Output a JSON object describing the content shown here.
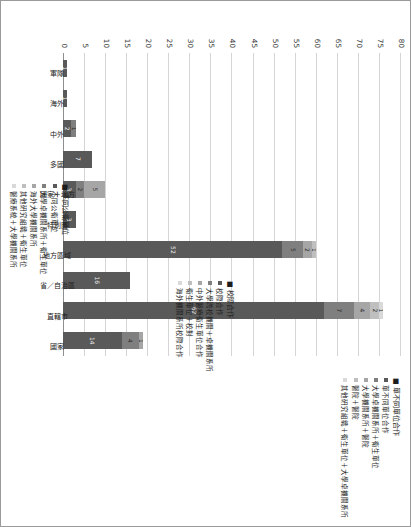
{
  "figure": {
    "orientation_note": "chart printed rotated 90 degrees on a portrait page"
  },
  "chart_data": {
    "type": "bar",
    "subtype": "stacked-column",
    "title": "",
    "xlabel": "",
    "ylabel": "",
    "ylim": [
      0,
      80
    ],
    "yticks": [
      0,
      5,
      10,
      15,
      20,
      25,
      30,
      35,
      40,
      45,
      50,
      55,
      60,
      65,
      70,
      75,
      80
    ],
    "ytick_labels": [
      "0",
      "5",
      "10",
      "15",
      "20",
      "25",
      "30",
      "35",
      "40",
      "45",
      "50",
      "55",
      "60",
      "65",
      "70",
      "75",
      "80"
    ],
    "grid": true,
    "legend_position": "right",
    "categories": [
      "軍隊",
      "海外",
      "中外",
      "多國",
      "國家＋地方",
      "特別區",
      "地方區域",
      "省／自治區",
      "直轄市",
      "國家"
    ],
    "totals": [
      1,
      1,
      3,
      7,
      10,
      3,
      60,
      16,
      76,
      19
    ],
    "series": [
      {
        "name": "單不同單位合作",
        "color": "#595959",
        "values": [
          1,
          1,
          2,
          7,
          3,
          3,
          52,
          16,
          62,
          14
        ]
      },
      {
        "name": "大學卓研究系所＋衛生單位",
        "color": "#7f7f7f",
        "values": [
          0,
          0,
          1,
          0,
          2,
          0,
          5,
          0,
          7,
          4
        ]
      },
      {
        "name": "大學機關系所＋醫院",
        "color": "#a6a6a6",
        "values": [
          0,
          0,
          0,
          0,
          5,
          0,
          2,
          0,
          4,
          1
        ]
      },
      {
        "name": "醫院＋醫院",
        "color": "#bfbfbf",
        "values": [
          0,
          0,
          0,
          0,
          0,
          0,
          1,
          0,
          2,
          0
        ]
      },
      {
        "name": "其他研究組織＋衛生單位＋大學卓機關系所",
        "color": "#d9d9d9",
        "values": [
          0,
          0,
          0,
          0,
          0,
          0,
          0,
          0,
          1,
          0
        ]
      }
    ],
    "segment_labels": {
      "軍隊": [
        "1"
      ],
      "海外": [
        "1"
      ],
      "中外": [
        "2",
        "1"
      ],
      "多國": [
        "7"
      ],
      "國家＋地方": [
        "3",
        "2",
        "5"
      ],
      "特別區": [
        "3"
      ],
      "地方區域": [
        "52",
        "5",
        "2",
        "1"
      ],
      "省／自治區": [
        "16"
      ],
      "直轄市": [
        "62",
        "7",
        "4",
        "2",
        "1",
        "1",
        "1"
      ],
      "國家": [
        "14",
        "4",
        "1"
      ]
    }
  },
  "legend": {
    "groups": [
      {
        "title": "單不同單位合作",
        "items": [
          {
            "label": "單不同單位合作",
            "color": "#595959"
          },
          {
            "label": "大學卓機關系所＋衛生單位",
            "color": "#7f7f7f"
          },
          {
            "label": "大學機關系所＋醫院",
            "color": "#a6a6a6"
          },
          {
            "label": "醫院＋醫院",
            "color": "#bfbfbf"
          },
          {
            "label": "其他研究組織＋衛生單位＋大學卓機關系所",
            "color": "#d9d9d9"
          }
        ]
      },
      {
        "title": "校際合作",
        "items": [
          {
            "label": "校際合作",
            "color": "#595959"
          },
          {
            "label": "大學跨校機關＋卓機關系所",
            "color": "#7f7f7f"
          },
          {
            "label": "中外醫療衛生單位合作",
            "color": "#a6a6a6"
          },
          {
            "label": "衛生單位＋校對",
            "color": "#bfbfbf"
          },
          {
            "label": "海外機關系所校際合作",
            "color": "#d9d9d9"
          }
        ]
      },
      {
        "title": "不同公衛單位",
        "items": [
          {
            "label": "不同公衛單位",
            "color": "#595959"
          },
          {
            "label": "大學卓機關系所＋衛生單位",
            "color": "#7f7f7f"
          },
          {
            "label": "海外大學機關系所",
            "color": "#a6a6a6"
          },
          {
            "label": "其他研究組織＋衛生單位",
            "color": "#bfbfbf"
          },
          {
            "label": "醫療系統＋大學機關系所",
            "color": "#d9d9d9"
          }
        ]
      }
    ]
  }
}
